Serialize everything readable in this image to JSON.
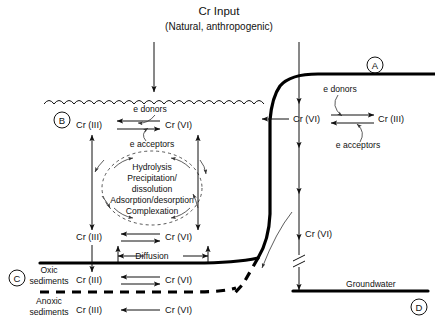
{
  "title": {
    "main": "Cr Input",
    "sub": "(Natural, anthropogenic)"
  },
  "keys": {
    "a": "A",
    "b": "B",
    "c": "C",
    "d": "D"
  },
  "species": {
    "cr3": "Cr (III)",
    "cr6": "Cr (VI)"
  },
  "redox": {
    "donors": "e donors",
    "acceptors": "e acceptors"
  },
  "processes": {
    "line1": "Hydrolysis",
    "line2": "Precipitation/",
    "line3": "dissolution",
    "line4": "Adsorption/desorption",
    "line5": "Complexation"
  },
  "zones": {
    "oxic_l1": "Oxic",
    "oxic_l2": "sediments",
    "anoxic_l1": "Anoxic",
    "anoxic_l2": "sediments",
    "groundwater": "Groundwater"
  },
  "transport": {
    "diffusion": "Diffusion",
    "vadose_species": "Cr (VI)"
  },
  "soil_zone": {
    "donors": "e donors",
    "acceptors": "e acceptors",
    "cr6": "Cr (VI)",
    "cr3": "Cr (III)"
  },
  "surface_water_zone": {
    "donors": "e donors",
    "acceptors": "e acceptors",
    "cr3": "Cr (III)",
    "cr6": "Cr (VI)"
  },
  "water_column_lower": {
    "cr3": "Cr (III)",
    "cr6": "Cr (VI)"
  },
  "oxic_row": {
    "cr3": "Cr (III)",
    "cr6": "Cr (VI)"
  },
  "anoxic_row": {
    "cr3": "Cr (III)",
    "cr6": "Cr (VI)"
  },
  "colors": {
    "ink": "#111111",
    "background": "#ffffff"
  }
}
